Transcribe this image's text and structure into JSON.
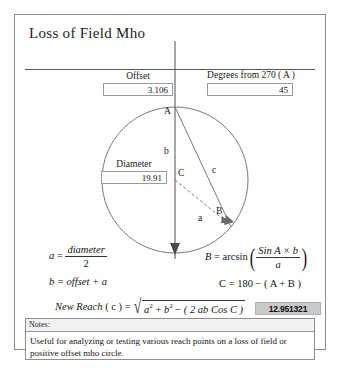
{
  "card": {
    "title": "Loss of Field Mho"
  },
  "fields": {
    "offset": {
      "label": "Offset",
      "value": "3.106"
    },
    "degrees": {
      "label": "Degrees from 270 ( A )",
      "value": "45"
    },
    "diameter": {
      "label": "Diameter",
      "value": "19.91"
    }
  },
  "diagram": {
    "labels": {
      "vertex_a": "A",
      "vertex_b": "B",
      "vertex_c": "C",
      "side_a": "a",
      "side_b": "b",
      "side_c": "c"
    }
  },
  "formulas": {
    "a": {
      "lhs": "a",
      "eq": "=",
      "num": "diameter",
      "den": "2"
    },
    "b": {
      "text": "b = offset + a"
    },
    "B": {
      "lhs": "B",
      "eq": "=",
      "fn": "arcsin",
      "num": "Sin A × b",
      "den": "a"
    },
    "C": {
      "text": "C = 180 − ( A + B )"
    },
    "reach": {
      "lhs": "New Reach",
      "var": "( c )",
      "eq": "=",
      "radicand_1": "a",
      "exp_1": "2",
      "plus": "+",
      "radicand_2": "b",
      "exp_2": "2",
      "minus": "−",
      "term": "( 2 ab Cos C )"
    }
  },
  "result": {
    "value": "12.951321"
  },
  "notes": {
    "header": "Notes:",
    "body": "Useful for analyzing or testing various reach points on a loss of field or positive offset mho circle."
  }
}
